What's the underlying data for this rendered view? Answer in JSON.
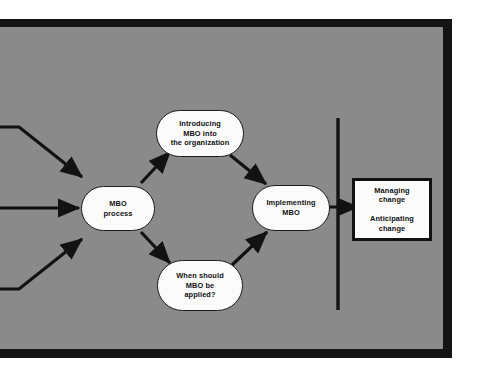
{
  "diagram": {
    "background_color": "#8a8a8a",
    "frame_color": "#141414",
    "node_fill": "#fbfbfb",
    "node_stroke": "#1c1c1c",
    "nodes": {
      "introducing": {
        "line1": "Introducing",
        "line2": "MBO into",
        "line3": "the organization"
      },
      "process": {
        "line1": "MBO",
        "line2": "process"
      },
      "when": {
        "line1": "When should",
        "line2": "MBO be",
        "line3": "applied?"
      },
      "implementing": {
        "line1": "Implementing",
        "line2": "MBO"
      },
      "outcome": {
        "block1_line1": "Managing",
        "block1_line2": "change",
        "block2_line1": "Anticipating",
        "block2_line2": "change"
      }
    },
    "connectors": [
      "inbound-upper-elbow-arrow",
      "inbound-middle-straight-arrow",
      "inbound-lower-elbow-arrow",
      "process-to-introducing-arrow",
      "process-to-when-arrow",
      "introducing-to-implementing-arrow",
      "when-to-implementing-arrow",
      "implementing-to-outcome-arrow"
    ],
    "divider": "vertical-divider-line"
  }
}
